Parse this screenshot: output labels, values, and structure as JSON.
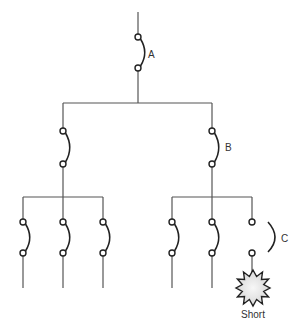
{
  "diagram": {
    "title": "",
    "colors": {
      "wire": "#555555",
      "contact": "#222222",
      "burst_fill": "#e6e6e6",
      "label": "#333333"
    },
    "labels": {
      "breaker_a": "A",
      "breaker_b": "B",
      "breaker_c": "C",
      "fault": "Short"
    },
    "breakers": [
      {
        "id": "A",
        "x": 138,
        "y_top": 37,
        "y_bottom": 68,
        "state": "closed",
        "labeled": true
      },
      {
        "id": "L1",
        "x": 63,
        "y_top": 131,
        "y_bottom": 164,
        "state": "closed",
        "labeled": false
      },
      {
        "id": "B",
        "x": 212,
        "y_top": 131,
        "y_bottom": 164,
        "state": "closed",
        "labeled": true
      },
      {
        "id": "LL1",
        "x": 23,
        "y_top": 222,
        "y_bottom": 253,
        "state": "closed",
        "labeled": false
      },
      {
        "id": "LL2",
        "x": 63,
        "y_top": 222,
        "y_bottom": 253,
        "state": "closed",
        "labeled": false
      },
      {
        "id": "LL3",
        "x": 103,
        "y_top": 222,
        "y_bottom": 253,
        "state": "closed",
        "labeled": false
      },
      {
        "id": "RR1",
        "x": 172,
        "y_top": 222,
        "y_bottom": 253,
        "state": "closed",
        "labeled": false
      },
      {
        "id": "RR2",
        "x": 212,
        "y_top": 222,
        "y_bottom": 253,
        "state": "closed",
        "labeled": false
      },
      {
        "id": "C",
        "x": 252,
        "y_top": 222,
        "y_bottom": 253,
        "state": "open",
        "labeled": true
      }
    ],
    "fault": {
      "x": 253,
      "y": 288,
      "points": 12
    }
  }
}
